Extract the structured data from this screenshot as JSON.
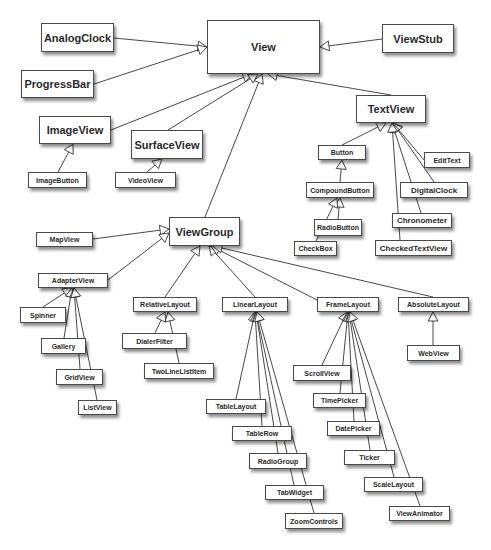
{
  "diagram": {
    "nodes": [
      {
        "id": "View",
        "label": "View",
        "x": 207,
        "y": 20,
        "w": 113,
        "h": 54,
        "size": "lg"
      },
      {
        "id": "AnalogClock",
        "label": "AnalogClock",
        "x": 41,
        "y": 23,
        "w": 73,
        "h": 29,
        "size": "lg"
      },
      {
        "id": "ProgressBar",
        "label": "ProgressBar",
        "x": 21,
        "y": 70,
        "w": 73,
        "h": 28,
        "size": "lg"
      },
      {
        "id": "ViewStub",
        "label": "ViewStub",
        "x": 382,
        "y": 24,
        "w": 72,
        "h": 29,
        "size": "lg"
      },
      {
        "id": "ImageView",
        "label": "ImageView",
        "x": 39,
        "y": 116,
        "w": 72,
        "h": 28,
        "size": "lg"
      },
      {
        "id": "SurfaceView",
        "label": "SurfaceView",
        "x": 131,
        "y": 130,
        "w": 72,
        "h": 29,
        "size": "lg"
      },
      {
        "id": "TextView",
        "label": "TextView",
        "x": 356,
        "y": 95,
        "w": 70,
        "h": 28,
        "size": "lg"
      },
      {
        "id": "ImageButton",
        "label": "ImageButton",
        "x": 28,
        "y": 172,
        "w": 59,
        "h": 16,
        "size": "sm"
      },
      {
        "id": "VideoView",
        "label": "VideoView",
        "x": 115,
        "y": 172,
        "w": 61,
        "h": 16,
        "size": "sm"
      },
      {
        "id": "Button",
        "label": "Button",
        "x": 318,
        "y": 145,
        "w": 48,
        "h": 15,
        "size": "sm"
      },
      {
        "id": "EditText",
        "label": "EditText",
        "x": 424,
        "y": 152,
        "w": 46,
        "h": 16,
        "size": "sm"
      },
      {
        "id": "CompoundButton",
        "label": "CompoundButton",
        "x": 306,
        "y": 182,
        "w": 68,
        "h": 16,
        "size": "sm"
      },
      {
        "id": "DigitalClock",
        "label": "DigitalClock",
        "x": 400,
        "y": 182,
        "w": 68,
        "h": 16,
        "size": "md"
      },
      {
        "id": "RadioButton",
        "label": "RadioButton",
        "x": 314,
        "y": 219,
        "w": 48,
        "h": 17,
        "size": "sm"
      },
      {
        "id": "CheckBox",
        "label": "CheckBox",
        "x": 294,
        "y": 241,
        "w": 43,
        "h": 15,
        "size": "sm"
      },
      {
        "id": "Chronometer",
        "label": "Chronometer",
        "x": 392,
        "y": 213,
        "w": 60,
        "h": 15,
        "size": "md"
      },
      {
        "id": "CheckedTextView",
        "label": "CheckedTextView",
        "x": 375,
        "y": 240,
        "w": 77,
        "h": 16,
        "size": "md"
      },
      {
        "id": "ViewGroup",
        "label": "ViewGroup",
        "x": 169,
        "y": 217,
        "w": 71,
        "h": 29,
        "size": "lg"
      },
      {
        "id": "MapView",
        "label": "MapView",
        "x": 36,
        "y": 232,
        "w": 57,
        "h": 15,
        "size": "sm"
      },
      {
        "id": "AdapterView",
        "label": "AdapterView",
        "x": 38,
        "y": 273,
        "w": 70,
        "h": 15,
        "size": "sm"
      },
      {
        "id": "Spinner",
        "label": "Spinner",
        "x": 20,
        "y": 307,
        "w": 46,
        "h": 16,
        "size": "sm"
      },
      {
        "id": "Gallery",
        "label": "Gallery",
        "x": 41,
        "y": 338,
        "w": 45,
        "h": 16,
        "size": "sm"
      },
      {
        "id": "GridView",
        "label": "GridView",
        "x": 56,
        "y": 369,
        "w": 47,
        "h": 16,
        "size": "sm"
      },
      {
        "id": "ListView",
        "label": "ListView",
        "x": 78,
        "y": 400,
        "w": 39,
        "h": 15,
        "size": "sm"
      },
      {
        "id": "RelativeLayout",
        "label": "RelativeLayout",
        "x": 133,
        "y": 297,
        "w": 64,
        "h": 15,
        "size": "sm"
      },
      {
        "id": "DialerFilter",
        "label": "DialerFilter",
        "x": 122,
        "y": 333,
        "w": 65,
        "h": 16,
        "size": "sm"
      },
      {
        "id": "TwoLineListItem",
        "label": "TwoLineListItem",
        "x": 144,
        "y": 363,
        "w": 70,
        "h": 16,
        "size": "sm"
      },
      {
        "id": "LinearLayout",
        "label": "LinearLayout",
        "x": 222,
        "y": 297,
        "w": 66,
        "h": 15,
        "size": "sm"
      },
      {
        "id": "FrameLayout",
        "label": "FrameLayout",
        "x": 317,
        "y": 297,
        "w": 62,
        "h": 15,
        "size": "sm"
      },
      {
        "id": "AbsoluteLayout",
        "label": "AbsoluteLayout",
        "x": 398,
        "y": 297,
        "w": 71,
        "h": 15,
        "size": "sm"
      },
      {
        "id": "WebView",
        "label": "WebView",
        "x": 407,
        "y": 345,
        "w": 53,
        "h": 16,
        "size": "sm"
      },
      {
        "id": "ScrollView",
        "label": "ScrollView",
        "x": 293,
        "y": 365,
        "w": 58,
        "h": 16,
        "size": "sm"
      },
      {
        "id": "TimePicker",
        "label": "TimePicker",
        "x": 313,
        "y": 393,
        "w": 53,
        "h": 15,
        "size": "sm"
      },
      {
        "id": "DatePicker",
        "label": "DatePicker",
        "x": 327,
        "y": 421,
        "w": 53,
        "h": 15,
        "size": "sm"
      },
      {
        "id": "Ticker",
        "label": "Ticker",
        "x": 344,
        "y": 450,
        "w": 51,
        "h": 15,
        "size": "sm"
      },
      {
        "id": "ScaleLayout",
        "label": "ScaleLayout",
        "x": 364,
        "y": 477,
        "w": 59,
        "h": 15,
        "size": "sm"
      },
      {
        "id": "ViewAnimator",
        "label": "ViewAnimator",
        "x": 389,
        "y": 506,
        "w": 61,
        "h": 15,
        "size": "sm"
      },
      {
        "id": "TableLayout",
        "label": "TableLayout",
        "x": 206,
        "y": 399,
        "w": 60,
        "h": 15,
        "size": "sm"
      },
      {
        "id": "TableRow",
        "label": "TableRow",
        "x": 232,
        "y": 426,
        "w": 60,
        "h": 15,
        "size": "sm"
      },
      {
        "id": "RadioGroup",
        "label": "RadioGroup",
        "x": 249,
        "y": 453,
        "w": 58,
        "h": 16,
        "size": "sm"
      },
      {
        "id": "TabWidget",
        "label": "TabWidget",
        "x": 265,
        "y": 485,
        "w": 59,
        "h": 15,
        "size": "sm"
      },
      {
        "id": "ZoomControls",
        "label": "ZoomControls",
        "x": 285,
        "y": 513,
        "w": 58,
        "h": 16,
        "size": "sm"
      }
    ],
    "edges": [
      {
        "from": "AnalogClock",
        "to": "View",
        "fx": 114,
        "fy": 38,
        "tx": 207,
        "ty": 47
      },
      {
        "from": "ProgressBar",
        "to": "View",
        "fx": 94,
        "fy": 84,
        "tx": 207,
        "ty": 47
      },
      {
        "from": "ViewStub",
        "to": "View",
        "fx": 382,
        "fy": 39,
        "tx": 320,
        "ty": 47
      },
      {
        "from": "ImageView",
        "to": "View",
        "fx": 111,
        "fy": 130,
        "tx": 252,
        "ty": 74
      },
      {
        "from": "SurfaceView",
        "to": "View",
        "fx": 168,
        "fy": 130,
        "tx": 258,
        "ty": 74
      },
      {
        "from": "ViewGroup",
        "to": "View",
        "fx": 205,
        "fy": 217,
        "tx": 262,
        "ty": 74
      },
      {
        "from": "TextView",
        "to": "View",
        "fx": 391,
        "fy": 95,
        "tx": 268,
        "ty": 74
      },
      {
        "from": "ImageButton",
        "to": "ImageView",
        "fx": 58,
        "fy": 172,
        "tx": 73,
        "ty": 144
      },
      {
        "from": "VideoView",
        "to": "SurfaceView",
        "fx": 147,
        "fy": 172,
        "tx": 162,
        "ty": 159
      },
      {
        "from": "Button",
        "to": "TextView",
        "fx": 342,
        "fy": 145,
        "tx": 386,
        "ty": 123
      },
      {
        "from": "EditText",
        "to": "TextView",
        "fx": 424,
        "fy": 160,
        "tx": 393,
        "ty": 123
      },
      {
        "from": "DigitalClock",
        "to": "TextView",
        "fx": 434,
        "fy": 182,
        "tx": 393,
        "ty": 123
      },
      {
        "from": "Chronometer",
        "to": "TextView",
        "fx": 421,
        "fy": 213,
        "tx": 392,
        "ty": 123
      },
      {
        "from": "CheckedTextView",
        "to": "TextView",
        "fx": 400,
        "fy": 240,
        "tx": 392,
        "ty": 123
      },
      {
        "from": "CompoundButton",
        "to": "Button",
        "fx": 340,
        "fy": 182,
        "tx": 342,
        "ty": 160
      },
      {
        "from": "RadioButton",
        "to": "CompoundButton",
        "fx": 338,
        "fy": 219,
        "tx": 340,
        "ty": 198
      },
      {
        "from": "CheckBox",
        "to": "CompoundButton",
        "fx": 316,
        "fy": 241,
        "tx": 337,
        "ty": 198
      },
      {
        "from": "MapView",
        "to": "ViewGroup",
        "fx": 93,
        "fy": 239,
        "tx": 169,
        "ty": 229
      },
      {
        "from": "AdapterView",
        "to": "ViewGroup",
        "fx": 108,
        "fy": 280,
        "tx": 169,
        "ty": 233
      },
      {
        "from": "RelativeLayout",
        "to": "ViewGroup",
        "fx": 165,
        "fy": 297,
        "tx": 200,
        "ty": 246
      },
      {
        "from": "LinearLayout",
        "to": "ViewGroup",
        "fx": 255,
        "fy": 297,
        "tx": 209,
        "ty": 246
      },
      {
        "from": "FrameLayout",
        "to": "ViewGroup",
        "fx": 317,
        "fy": 300,
        "tx": 211,
        "ty": 246
      },
      {
        "from": "AbsoluteLayout",
        "to": "ViewGroup",
        "fx": 433,
        "fy": 297,
        "tx": 213,
        "ty": 246
      },
      {
        "from": "Spinner",
        "to": "AdapterView",
        "fx": 43,
        "fy": 307,
        "tx": 72,
        "ty": 288
      },
      {
        "from": "Gallery",
        "to": "AdapterView",
        "fx": 64,
        "fy": 338,
        "tx": 72,
        "ty": 288
      },
      {
        "from": "GridView",
        "to": "AdapterView",
        "fx": 80,
        "fy": 369,
        "tx": 74,
        "ty": 288
      },
      {
        "from": "ListView",
        "to": "AdapterView",
        "fx": 97,
        "fy": 400,
        "tx": 74,
        "ty": 288
      },
      {
        "from": "DialerFilter",
        "to": "RelativeLayout",
        "fx": 155,
        "fy": 333,
        "tx": 165,
        "ty": 312
      },
      {
        "from": "TwoLineListItem",
        "to": "RelativeLayout",
        "fx": 179,
        "fy": 363,
        "tx": 168,
        "ty": 312
      },
      {
        "from": "TableLayout",
        "to": "LinearLayout",
        "fx": 236,
        "fy": 399,
        "tx": 255,
        "ty": 312
      },
      {
        "from": "TableRow",
        "to": "LinearLayout",
        "fx": 262,
        "fy": 426,
        "tx": 255,
        "ty": 312
      },
      {
        "from": "RadioGroup",
        "to": "LinearLayout",
        "fx": 278,
        "fy": 453,
        "tx": 256,
        "ty": 312
      },
      {
        "from": "TabWidget",
        "to": "LinearLayout",
        "fx": 294,
        "fy": 485,
        "tx": 256,
        "ty": 312
      },
      {
        "from": "ZoomControls",
        "to": "LinearLayout",
        "fx": 314,
        "fy": 513,
        "tx": 257,
        "ty": 312
      },
      {
        "from": "ScrollView",
        "to": "FrameLayout",
        "fx": 322,
        "fy": 365,
        "tx": 347,
        "ty": 312
      },
      {
        "from": "TimePicker",
        "to": "FrameLayout",
        "fx": 340,
        "fy": 393,
        "tx": 348,
        "ty": 312
      },
      {
        "from": "DatePicker",
        "to": "FrameLayout",
        "fx": 354,
        "fy": 421,
        "tx": 348,
        "ty": 312
      },
      {
        "from": "Ticker",
        "to": "FrameLayout",
        "fx": 370,
        "fy": 450,
        "tx": 349,
        "ty": 312
      },
      {
        "from": "ScaleLayout",
        "to": "FrameLayout",
        "fx": 394,
        "fy": 477,
        "tx": 349,
        "ty": 312
      },
      {
        "from": "ViewAnimator",
        "to": "FrameLayout",
        "fx": 420,
        "fy": 506,
        "tx": 350,
        "ty": 312
      },
      {
        "from": "WebView",
        "to": "AbsoluteLayout",
        "fx": 433,
        "fy": 345,
        "tx": 433,
        "ty": 312
      }
    ],
    "colors": {
      "line": "#333333",
      "border": "#4a4a4a",
      "text": "#2a2a2a",
      "fill": "#ffffff",
      "background": "#ffffff"
    }
  }
}
